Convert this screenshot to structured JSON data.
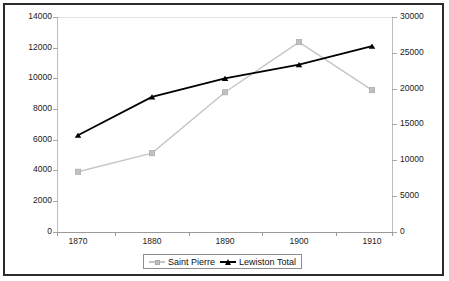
{
  "chart_data": {
    "type": "line",
    "title": "",
    "xlabel": "",
    "ylabel": "",
    "categories": [
      "1870",
      "1880",
      "1890",
      "1900",
      "1910"
    ],
    "x": [
      1870,
      1880,
      1890,
      1900,
      1910
    ],
    "grid": false,
    "legend_position": "bottom",
    "axes": {
      "left": {
        "label": "",
        "ylim": [
          0,
          14000
        ],
        "ticks": [
          0,
          2000,
          4000,
          6000,
          8000,
          10000,
          12000,
          14000
        ],
        "tick_labels": [
          "0",
          "2000",
          "4000",
          "6000",
          "8000",
          "10000",
          "12000",
          "14000"
        ]
      },
      "right": {
        "label": "",
        "ylim": [
          0,
          30000
        ],
        "ticks": [
          0,
          5000,
          10000,
          15000,
          20000,
          25000,
          30000
        ],
        "tick_labels": [
          "0",
          "5000",
          "10000",
          "15000",
          "20000",
          "25000",
          "30000"
        ]
      },
      "x": {
        "tick_labels": [
          "1870",
          "1880",
          "1890",
          "1900",
          "1910"
        ]
      }
    },
    "series": [
      {
        "name": "Saint Pierre",
        "axis": "right",
        "color": "#c6c6c6",
        "marker": "square",
        "values": [
          8400,
          11000,
          19500,
          26500,
          19800
        ]
      },
      {
        "name": "Lewiston Total",
        "axis": "left",
        "color": "#000000",
        "marker": "triangle",
        "values": [
          6300,
          8800,
          10000,
          10900,
          12100
        ]
      }
    ]
  },
  "legend": {
    "entries": [
      {
        "label": "Saint Pierre"
      },
      {
        "label": "Lewiston Total"
      }
    ]
  },
  "colors": {
    "saint_pierre": "#c6c6c6",
    "lewiston_total": "#000000",
    "frame": "#2b2b2b",
    "axis": "#9a9a9a"
  }
}
